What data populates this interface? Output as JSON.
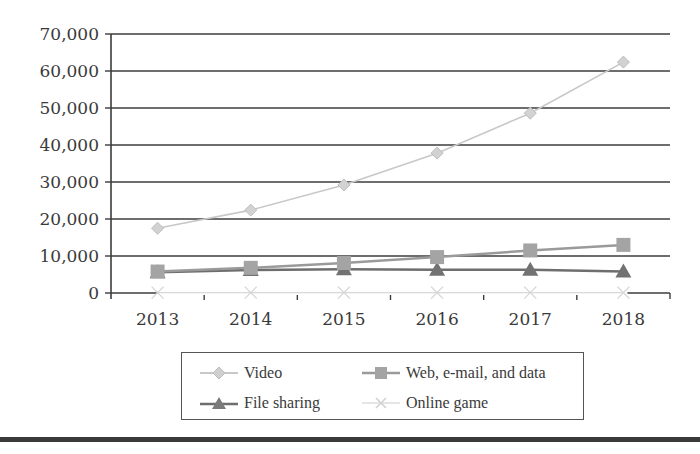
{
  "chart_data": {
    "type": "line",
    "title": "",
    "xlabel": "",
    "ylabel": "",
    "categories": [
      "2013",
      "2014",
      "2015",
      "2016",
      "2017",
      "2018"
    ],
    "ylim": [
      0,
      70000
    ],
    "yticks": [
      0,
      10000,
      20000,
      30000,
      40000,
      50000,
      60000,
      70000
    ],
    "ytick_labels": [
      "0",
      "10,000",
      "20,000",
      "30,000",
      "40,000",
      "50,000",
      "60,000",
      "70,000"
    ],
    "grid": "horizontal",
    "legend_position": "bottom",
    "series": [
      {
        "name": "Video",
        "marker": "diamond",
        "color": "#c8c8c8",
        "values": [
          17500,
          22400,
          29200,
          37800,
          48600,
          62400
        ]
      },
      {
        "name": "Web, e-mail, and data",
        "marker": "square",
        "color": "#9a9a9a",
        "values": [
          5800,
          6800,
          8100,
          9700,
          11500,
          13000
        ]
      },
      {
        "name": "File sharing",
        "marker": "triangle",
        "color": "#6e6e6e",
        "values": [
          5600,
          6200,
          6400,
          6300,
          6300,
          5800
        ]
      },
      {
        "name": "Online game",
        "marker": "x",
        "color": "#d8d8d8",
        "values": [
          100,
          100,
          100,
          100,
          100,
          100
        ]
      }
    ]
  },
  "legend": {
    "items": [
      {
        "label": "Video"
      },
      {
        "label": "Web, e-mail, and data"
      },
      {
        "label": "File sharing"
      },
      {
        "label": "Online game"
      }
    ]
  }
}
